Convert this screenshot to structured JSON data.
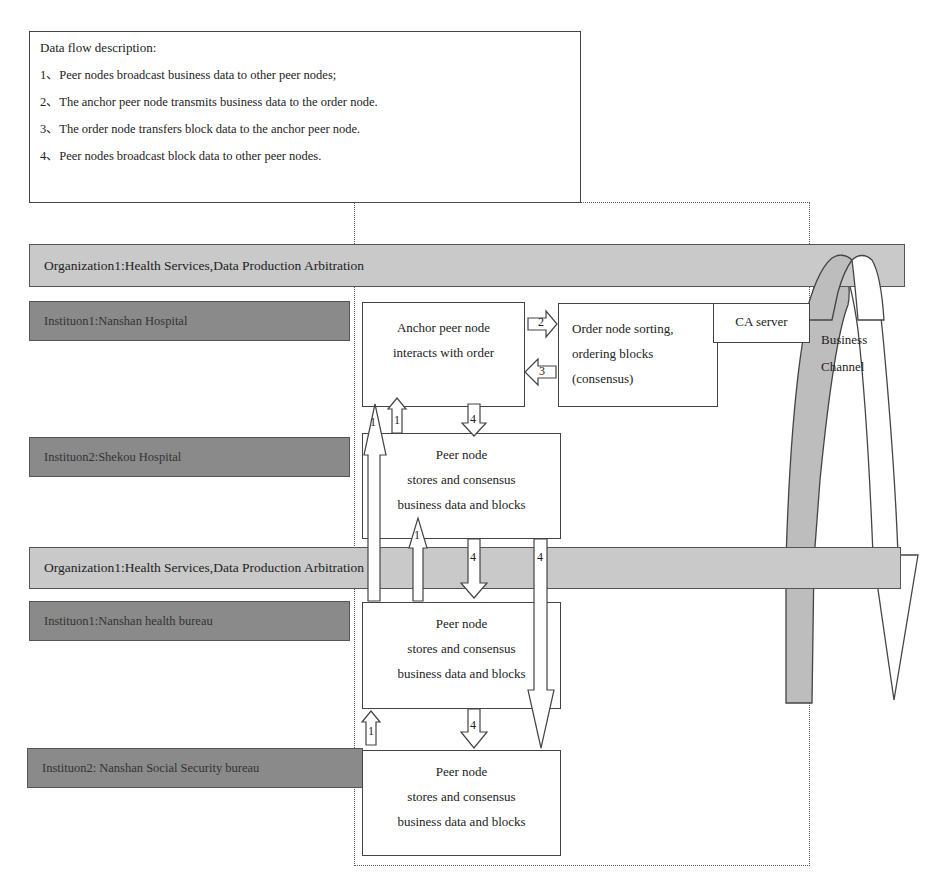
{
  "legend": {
    "title": "Data flow description:",
    "items": [
      "1、Peer nodes broadcast business data to other peer nodes;",
      "2、The anchor peer node transmits business data to the order node.",
      "3、The order node transfers block data to the anchor peer node.",
      "4、Peer nodes broadcast block data to other peer nodes."
    ]
  },
  "organizations": [
    {
      "label": "Organization1:Health Services,Data Production Arbitration"
    },
    {
      "label": "Organization1:Health Services,Data Production Arbitration"
    }
  ],
  "institutions": [
    {
      "label": "Instituon1:Nanshan Hospital"
    },
    {
      "label": "Instituon2:Shekou Hospital"
    },
    {
      "label": "Instituon1:Nanshan health bureau"
    },
    {
      "label": "Instituon2: Nanshan Social Security bureau"
    }
  ],
  "nodes": {
    "anchor": {
      "lines": [
        "Anchor peer node",
        "interacts with order"
      ]
    },
    "order": {
      "lines": [
        "Order node sorting,",
        "ordering blocks",
        "(consensus)"
      ]
    },
    "ca": {
      "label": "CA server"
    },
    "peer1": {
      "lines": [
        "Peer node",
        "stores and consensus",
        "business data and blocks"
      ]
    },
    "peer2": {
      "lines": [
        "Peer node",
        "stores and consensus",
        "business data and blocks"
      ]
    },
    "peer3": {
      "lines": [
        "Peer node",
        "stores and consensus",
        "business data and blocks"
      ]
    }
  },
  "channel": {
    "lines": [
      "Business",
      "Channel"
    ]
  },
  "arrows": {
    "flow1": "1",
    "flow2": "2",
    "flow3": "3",
    "flow4": "4"
  },
  "colors": {
    "org_bar": "#c9c9c9",
    "inst_bar": "#8a8a8a",
    "channel_arc": "#bdbdbd",
    "stroke": "#444444"
  }
}
